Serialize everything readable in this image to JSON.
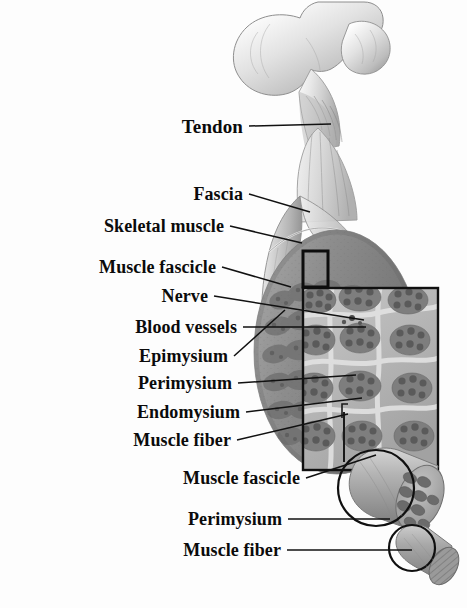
{
  "figure": {
    "background_color": "#fdfdfd",
    "label_color": "#0b0b0b",
    "leader_line_color": "#111111",
    "style": "grayscale anatomical illustration, bold serif labels with straight leader lines"
  },
  "labels": [
    {
      "id": "tendon",
      "text": "Tendon",
      "x": 243,
      "y": 126,
      "size": 19,
      "line_to_x": 331,
      "line_to_y": 124
    },
    {
      "id": "fascia",
      "text": "Fascia",
      "x": 243,
      "y": 194,
      "size": 18,
      "line_to_x": 310,
      "line_to_y": 212
    },
    {
      "id": "skeletal-muscle",
      "text": "Skeletal muscle",
      "x": 224,
      "y": 226,
      "size": 18,
      "line_to_x": 302,
      "line_to_y": 243
    },
    {
      "id": "muscle-fascicle-1",
      "text": "Muscle fascicle",
      "x": 216,
      "y": 267,
      "size": 18,
      "line_to_x": 291,
      "line_to_y": 287
    },
    {
      "id": "nerve",
      "text": "Nerve",
      "x": 208,
      "y": 296,
      "size": 18,
      "line_to_x": 364,
      "line_to_y": 320
    },
    {
      "id": "blood-vessels",
      "text": "Blood vessels",
      "x": 237,
      "y": 327,
      "size": 18,
      "line_to_x": 366,
      "line_to_y": 327
    },
    {
      "id": "epimysium",
      "text": "Epimysium",
      "x": 228,
      "y": 356,
      "size": 18,
      "line_to_x": 285,
      "line_to_y": 310
    },
    {
      "id": "perimysium-1",
      "text": "Perimysium",
      "x": 232,
      "y": 383,
      "size": 18,
      "line_to_x": 356,
      "line_to_y": 375
    },
    {
      "id": "endomysium",
      "text": "Endomysium",
      "x": 240,
      "y": 412,
      "size": 18,
      "line_to_x": 362,
      "line_to_y": 398
    },
    {
      "id": "muscle-fiber-1",
      "text": "Muscle fiber",
      "x": 231,
      "y": 440,
      "size": 18,
      "line_to_x": 348,
      "line_to_y": 414
    },
    {
      "id": "muscle-fascicle-2",
      "text": "Muscle fascicle",
      "x": 300,
      "y": 478,
      "size": 18,
      "line_to_x": 376,
      "line_to_y": 455
    },
    {
      "id": "perimysium-2",
      "text": "Perimysium",
      "x": 282,
      "y": 519,
      "size": 18,
      "line_to_x": 390,
      "line_to_y": 519
    },
    {
      "id": "muscle-fiber-2",
      "text": "Muscle fiber",
      "x": 281,
      "y": 550,
      "size": 18,
      "line_to_x": 412,
      "line_to_y": 550
    }
  ],
  "structures": [
    {
      "id": "femur",
      "name": "Femur (proximal head, neck and greater trochanter)"
    },
    {
      "id": "tendon",
      "name": "Tendon attaching muscle to bone"
    },
    {
      "id": "muscle-belly",
      "name": "Skeletal muscle belly with cut-away fascia and epimysium"
    },
    {
      "id": "callout-box",
      "name": "Small outlined region marking the magnified area"
    },
    {
      "id": "magnified-inset",
      "name": "Magnified cross-section of fascicles, perimysium and endomysium"
    },
    {
      "id": "fascicle-cylinder",
      "name": "Single muscle fascicle drawn out of the cross-section"
    },
    {
      "id": "fiber-cylinder",
      "name": "Single muscle fiber drawn out of the fascicle"
    }
  ]
}
